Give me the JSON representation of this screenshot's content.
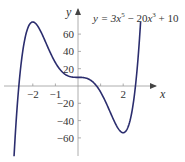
{
  "chart_data": {
    "type": "line",
    "title": "",
    "equation": "y = 3x^5 − 20x^3 + 10",
    "equation_parts": {
      "lhs": "y = 3",
      "v1": "x",
      "e1": "5",
      "mid": " − 20",
      "v2": "x",
      "e2": "3",
      "tail": " + 10"
    },
    "xlabel": "x",
    "ylabel": "y",
    "xlim": [
      -2.85,
      3.3
    ],
    "ylim": [
      -82,
      90
    ],
    "x_ticks": [
      -2,
      -1,
      1,
      2
    ],
    "x_tick_labels": [
      {
        "value": -2,
        "label": "−2"
      },
      {
        "value": -1,
        "label": "−1"
      },
      {
        "value": 2,
        "label": "2"
      }
    ],
    "y_ticks": [
      60,
      40,
      20,
      -20,
      -40,
      -60
    ],
    "y_tick_labels": [
      {
        "value": 60,
        "label": "60"
      },
      {
        "value": 40,
        "label": "40"
      },
      {
        "value": 20,
        "label": "20"
      },
      {
        "value": -20,
        "label": "−20"
      },
      {
        "value": -40,
        "label": "−40"
      },
      {
        "value": -60,
        "label": "−60"
      }
    ],
    "grid": false,
    "legend": "none",
    "series": [
      {
        "name": "y = 3x^5 − 20x^3 + 10",
        "coefficients": {
          "x5": 3,
          "x3": -20,
          "x0": 10
        },
        "x_range": [
          -2.83,
          2.77
        ],
        "key_points": [
          {
            "x": -2,
            "y": 74,
            "note": "local max"
          },
          {
            "x": 0,
            "y": 10,
            "note": "inflection/plateau"
          },
          {
            "x": 2,
            "y": -54,
            "note": "local min"
          }
        ]
      }
    ],
    "colors": {
      "curve": "#2b2d6e",
      "axes": "#888888",
      "text": "#333333"
    }
  }
}
